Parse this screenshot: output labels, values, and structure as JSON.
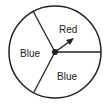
{
  "diagram": {
    "type": "spinner",
    "sections": [
      {
        "label": "Red"
      },
      {
        "label": "Blue"
      },
      {
        "label": "Blue"
      }
    ],
    "colors": {
      "stroke": "#222222",
      "background": "#ffffff"
    }
  }
}
